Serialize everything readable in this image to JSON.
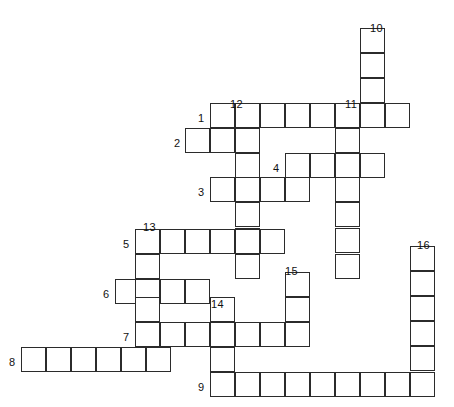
{
  "puzzle": {
    "type": "crossword-grid",
    "width": 454,
    "height": 407,
    "cell_size": 25,
    "line_color": "#2b2b2b",
    "cell_fill": "#ffffff",
    "background": "#ffffff",
    "origin_x": 10,
    "origin_y": 20,
    "columns_count": 17,
    "rows_count": 15,
    "entries": [
      {
        "number": "1",
        "direction": "across",
        "label_x": 198,
        "label_y": 113,
        "start_col": 8,
        "start_row": 4,
        "length": 8,
        "cells_x": 210,
        "cells_y": 103
      },
      {
        "number": "2",
        "direction": "across",
        "label_x": 174,
        "label_y": 138,
        "start_col": 7,
        "start_row": 5,
        "length": 3,
        "cells_x": 185,
        "cells_y": 128
      },
      {
        "number": "3",
        "direction": "across",
        "label_x": 198,
        "label_y": 187,
        "start_col": 8,
        "start_row": 7,
        "length": 4,
        "cells_x": 210,
        "cells_y": 177
      },
      {
        "number": "4",
        "direction": "across",
        "label_x": 273,
        "label_y": 163,
        "start_col": 11,
        "start_row": 6,
        "length": 4,
        "cells_x": 285,
        "cells_y": 153
      },
      {
        "number": "5",
        "direction": "across",
        "label_x": 123,
        "label_y": 239,
        "start_col": 5,
        "start_row": 9,
        "length": 6,
        "cells_x": 135,
        "cells_y": 229
      },
      {
        "number": "6",
        "direction": "across",
        "label_x": 103,
        "label_y": 289,
        "start_col": 4,
        "start_row": 11,
        "length": 4,
        "cells_x": 115,
        "cells_y": 279
      },
      {
        "number": "7",
        "direction": "across",
        "label_x": 123,
        "label_y": 332,
        "start_col": 5,
        "start_row": 12,
        "length": 7,
        "cells_x": 135,
        "cells_y": 322
      },
      {
        "number": "8",
        "direction": "across",
        "label_x": 9,
        "label_y": 357,
        "start_col": 0,
        "start_row": 13,
        "length": 6,
        "cells_x": 21,
        "cells_y": 347
      },
      {
        "number": "9",
        "direction": "across",
        "label_x": 198,
        "label_y": 382,
        "start_col": 8,
        "start_row": 14,
        "length": 9,
        "cells_x": 210,
        "cells_y": 372
      },
      {
        "number": "10",
        "direction": "down",
        "label_x": 370,
        "label_y": 23,
        "start_col": 14,
        "start_row": 0,
        "length": 3,
        "cells_x": 360,
        "cells_y": 28
      },
      {
        "number": "11",
        "direction": "down",
        "label_x": 345,
        "label_y": 99,
        "start_col": 13,
        "start_row": 3,
        "length": 7,
        "cells_x": 335,
        "cells_y": 103
      },
      {
        "number": "12",
        "direction": "down",
        "label_x": 230,
        "label_y": 99,
        "start_col": 9,
        "start_row": 3,
        "length": 6,
        "cells_x": 235,
        "cells_y": 103
      },
      {
        "number": "13",
        "direction": "down",
        "label_x": 143,
        "label_y": 222,
        "start_col": 5,
        "start_row": 8,
        "length": 5,
        "cells_x": 135,
        "cells_y": 229
      },
      {
        "number": "14",
        "direction": "down",
        "label_x": 211,
        "label_y": 299,
        "start_col": 8,
        "start_row": 11,
        "length": 4,
        "cells_x": 210,
        "cells_y": 297
      },
      {
        "number": "15",
        "direction": "down",
        "label_x": 285,
        "label_y": 266,
        "start_col": 11,
        "start_row": 10,
        "length": 4,
        "cells_x": 285,
        "cells_y": 272
      },
      {
        "number": "16",
        "direction": "down",
        "label_x": 417,
        "label_y": 240,
        "start_col": 16,
        "start_row": 9,
        "length": 6,
        "cells_x": 410,
        "cells_y": 246
      }
    ],
    "cells": [
      {
        "x": 360,
        "y": 28
      },
      {
        "x": 360,
        "y": 53
      },
      {
        "x": 360,
        "y": 78
      },
      {
        "x": 210,
        "y": 103
      },
      {
        "x": 235,
        "y": 103
      },
      {
        "x": 260,
        "y": 103
      },
      {
        "x": 285,
        "y": 103
      },
      {
        "x": 310,
        "y": 103
      },
      {
        "x": 335,
        "y": 103
      },
      {
        "x": 360,
        "y": 103
      },
      {
        "x": 385,
        "y": 103
      },
      {
        "x": 185,
        "y": 128
      },
      {
        "x": 210,
        "y": 128
      },
      {
        "x": 235,
        "y": 128
      },
      {
        "x": 335,
        "y": 128
      },
      {
        "x": 235,
        "y": 153
      },
      {
        "x": 285,
        "y": 153
      },
      {
        "x": 310,
        "y": 153
      },
      {
        "x": 335,
        "y": 153
      },
      {
        "x": 360,
        "y": 153
      },
      {
        "x": 210,
        "y": 177
      },
      {
        "x": 235,
        "y": 177
      },
      {
        "x": 260,
        "y": 177
      },
      {
        "x": 285,
        "y": 177
      },
      {
        "x": 335,
        "y": 177
      },
      {
        "x": 235,
        "y": 202
      },
      {
        "x": 335,
        "y": 202
      },
      {
        "x": 235,
        "y": 228
      },
      {
        "x": 335,
        "y": 228
      },
      {
        "x": 135,
        "y": 229
      },
      {
        "x": 160,
        "y": 229
      },
      {
        "x": 185,
        "y": 229
      },
      {
        "x": 210,
        "y": 229
      },
      {
        "x": 235,
        "y": 229
      },
      {
        "x": 260,
        "y": 229
      },
      {
        "x": 135,
        "y": 254
      },
      {
        "x": 235,
        "y": 254
      },
      {
        "x": 335,
        "y": 254
      },
      {
        "x": 410,
        "y": 246
      },
      {
        "x": 410,
        "y": 271
      },
      {
        "x": 115,
        "y": 279
      },
      {
        "x": 135,
        "y": 279
      },
      {
        "x": 160,
        "y": 279
      },
      {
        "x": 185,
        "y": 279
      },
      {
        "x": 285,
        "y": 272
      },
      {
        "x": 135,
        "y": 297
      },
      {
        "x": 210,
        "y": 297
      },
      {
        "x": 285,
        "y": 297
      },
      {
        "x": 410,
        "y": 296
      },
      {
        "x": 135,
        "y": 322
      },
      {
        "x": 160,
        "y": 322
      },
      {
        "x": 185,
        "y": 322
      },
      {
        "x": 210,
        "y": 322
      },
      {
        "x": 235,
        "y": 322
      },
      {
        "x": 260,
        "y": 322
      },
      {
        "x": 285,
        "y": 322
      },
      {
        "x": 410,
        "y": 321
      },
      {
        "x": 21,
        "y": 347
      },
      {
        "x": 46,
        "y": 347
      },
      {
        "x": 71,
        "y": 347
      },
      {
        "x": 96,
        "y": 347
      },
      {
        "x": 121,
        "y": 347
      },
      {
        "x": 146,
        "y": 347
      },
      {
        "x": 210,
        "y": 347
      },
      {
        "x": 410,
        "y": 346
      },
      {
        "x": 210,
        "y": 372
      },
      {
        "x": 235,
        "y": 372
      },
      {
        "x": 260,
        "y": 372
      },
      {
        "x": 285,
        "y": 372
      },
      {
        "x": 310,
        "y": 372
      },
      {
        "x": 335,
        "y": 372
      },
      {
        "x": 360,
        "y": 372
      },
      {
        "x": 385,
        "y": 372
      },
      {
        "x": 410,
        "y": 372
      }
    ]
  }
}
